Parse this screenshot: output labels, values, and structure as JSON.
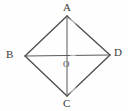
{
  "figure": {
    "type": "geometry-diagram",
    "shape": "rhombus",
    "background_color": "#fefefe",
    "stroke_color": "#4a4a4a",
    "label_color": "#3a3a3a",
    "width": 128,
    "height": 111,
    "vertices": [
      {
        "id": "A",
        "label": "A",
        "x": 67,
        "y": 16,
        "label_x": 63,
        "label_y": 2
      },
      {
        "id": "B",
        "label": "B",
        "x": 25,
        "y": 56,
        "label_x": 6,
        "label_y": 49
      },
      {
        "id": "D",
        "label": "D",
        "x": 110,
        "y": 55,
        "label_x": 114,
        "label_y": 47
      },
      {
        "id": "C",
        "label": "C",
        "x": 67,
        "y": 96,
        "label_x": 63,
        "label_y": 98
      }
    ],
    "center": {
      "id": "O",
      "label": "O",
      "x": 67,
      "y": 56,
      "label_x": 63,
      "label_y": 60
    },
    "edges": [
      {
        "from": "B",
        "to": "A"
      },
      {
        "from": "A",
        "to": "D"
      },
      {
        "from": "D",
        "to": "C"
      },
      {
        "from": "C",
        "to": "B"
      }
    ],
    "diagonals": [
      {
        "from": "A",
        "to": "C"
      },
      {
        "from": "B",
        "to": "D"
      }
    ],
    "artifact": {
      "name": "scan-band",
      "x": 69,
      "width": 8
    }
  }
}
